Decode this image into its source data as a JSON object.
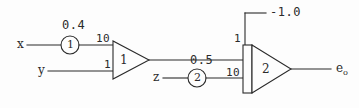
{
  "diagram": {
    "ink_color": "#2b2b2b",
    "background_color": "#fdfdfd"
  },
  "inputs": [
    {
      "name": "x-input-label",
      "label": "x"
    },
    {
      "name": "y-input-label",
      "label": "y"
    },
    {
      "name": "z-input-label",
      "label": "z"
    }
  ],
  "potentiometers": [
    {
      "id": "pot-1",
      "inner": "1",
      "setting": "0.4"
    },
    {
      "id": "pot-2",
      "inner": "2",
      "setting": "0.5"
    }
  ],
  "amplifiers": [
    {
      "id": "amp-1",
      "gain_symbol": "1",
      "input_gains": [
        "10",
        "1"
      ]
    },
    {
      "id": "amp-2",
      "gain_symbol": "2",
      "input_gains": [
        "1",
        "10"
      ]
    }
  ],
  "bias": {
    "label": "-1.0"
  },
  "output": {
    "label_base": "e",
    "label_sub": "o"
  },
  "gain_labels": {
    "amp1_top": "10",
    "amp1_bottom": "1",
    "amp1_inner": "1",
    "amp2_top": "1",
    "amp2_bottom": "10",
    "amp2_inner": "2",
    "pot1_value": "0.4",
    "pot1_inner": "1",
    "pot2_value": "0.5",
    "pot2_inner": "2"
  }
}
